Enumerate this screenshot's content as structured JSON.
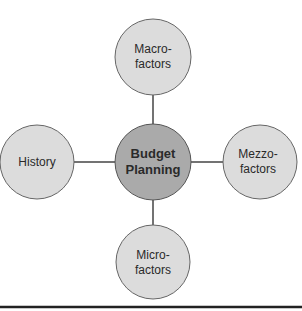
{
  "diagram": {
    "center": {
      "line1": "Budget",
      "line2": "Planning",
      "fill": "#aaaaaa"
    },
    "nodes": {
      "top": {
        "line1": "Macro-",
        "line2": "factors"
      },
      "left": {
        "line1": "History"
      },
      "right": {
        "line1": "Mezzo-",
        "line2": "factors"
      },
      "bottom": {
        "line1": "Micro-",
        "line2": "factors"
      }
    },
    "node_fill": "#dcdcdc",
    "stroke": "#555555"
  }
}
